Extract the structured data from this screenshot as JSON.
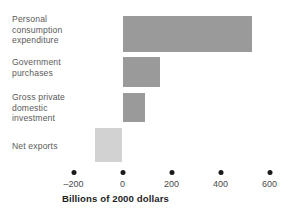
{
  "chart_data": {
    "type": "bar",
    "orientation": "horizontal",
    "title": "",
    "xlabel": "Billions of 2000 dollars",
    "ylabel": "",
    "categories": [
      "Personal\nconsumption\nexpenditure",
      "Government\npurchases",
      "Gross private\ndomestic\ninvestment",
      "Net exports"
    ],
    "values": [
      530,
      152,
      90,
      -112
    ],
    "xlim": [
      -280,
      620
    ],
    "xticks": [
      -200,
      0,
      200,
      400,
      600
    ],
    "xtick_labels": [
      "–200",
      "0",
      "200",
      "400",
      "600"
    ],
    "grid": false,
    "legend": "none",
    "colors": {
      "positive_bar": "#9a9a9a",
      "negative_bar": "#d2d2d2",
      "tick_dot": "#1a1a1a",
      "label_text": "#5a5a5a",
      "axis_title_text": "#1f1f1f",
      "background": "#ffffff"
    }
  }
}
